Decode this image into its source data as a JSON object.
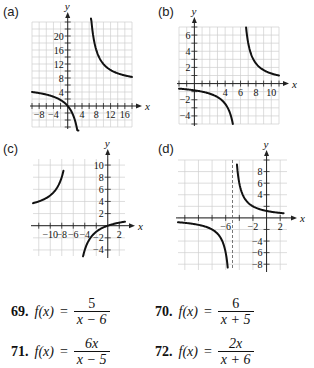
{
  "chart_data": [
    {
      "id": "a",
      "label": "(a)",
      "type": "line",
      "function": "6x/(x-5)",
      "x_range": [
        -10,
        18
      ],
      "y_range": [
        -6,
        24
      ],
      "x_ticks": [
        -8,
        -4,
        4,
        8,
        12,
        16
      ],
      "y_ticks": [
        4,
        8,
        12,
        16,
        20
      ],
      "grid_step": [
        2,
        2
      ],
      "vertical_asymptote": 5,
      "horizontal_asymptote": 6,
      "branches": [
        {
          "x_start": -10,
          "x_end": 3.0
        },
        {
          "x_start": 6.5,
          "x_end": 18
        }
      ],
      "xlabel": "x",
      "ylabel": "y",
      "dashed_asymptote": false
    },
    {
      "id": "b",
      "label": "(b)",
      "type": "line",
      "function": "5/(x-6)",
      "x_range": [
        -2,
        11
      ],
      "y_range": [
        -5,
        7
      ],
      "x_ticks": [
        4,
        6,
        8,
        10
      ],
      "y_ticks": [
        -4,
        -2,
        2,
        4,
        6
      ],
      "extra_x_ticks": [
        2
      ],
      "grid_step": [
        1,
        1
      ],
      "vertical_asymptote": 6,
      "horizontal_asymptote": 0,
      "branches": [
        {
          "x_start": -2,
          "x_end": 5.0
        },
        {
          "x_start": 6.72,
          "x_end": 11
        }
      ],
      "xlabel": "x",
      "ylabel": "y",
      "dashed_asymptote": false
    },
    {
      "id": "c",
      "label": "(c)",
      "type": "line",
      "function": "2x/(x+6)",
      "x_range": [
        -13,
        3
      ],
      "y_range": [
        -5,
        11
      ],
      "x_ticks": [
        -10,
        -8,
        -6,
        -4,
        2
      ],
      "y_ticks": [
        -4,
        -2,
        2,
        4,
        6,
        8,
        10
      ],
      "grid_step": [
        2,
        2
      ],
      "vertical_asymptote": -6,
      "horizontal_asymptote": 2,
      "branches": [
        {
          "x_start": -13,
          "x_end": -7.7
        },
        {
          "x_start": -4.3,
          "x_end": 3
        }
      ],
      "xlabel": "x",
      "ylabel": "y",
      "dashed_asymptote": false
    },
    {
      "id": "d",
      "label": "(d)",
      "type": "line",
      "function": "6/(x+5)",
      "x_range": [
        -13,
        3
      ],
      "y_range": [
        -9,
        10
      ],
      "x_ticks": [
        -6,
        -2,
        2
      ],
      "y_ticks": [
        -8,
        -6,
        -4,
        4,
        6,
        8
      ],
      "grid_step": [
        2,
        2
      ],
      "vertical_asymptote": -5,
      "horizontal_asymptote": 0,
      "branches": [
        {
          "x_start": -13,
          "x_end": -5.7
        },
        {
          "x_start": -4.35,
          "x_end": 2.5
        }
      ],
      "xlabel": "x",
      "ylabel": "y",
      "dashed_asymptote": true
    }
  ],
  "panels": {
    "a": {
      "label": "(a)"
    },
    "b": {
      "label": "(b)"
    },
    "c": {
      "label": "(c)"
    },
    "d": {
      "label": "(d)"
    }
  },
  "exercises": [
    {
      "number": "69.",
      "lhs": "f(x)",
      "eq": "=",
      "numerator": "5",
      "denominator": "x − 6"
    },
    {
      "number": "70.",
      "lhs": "f(x)",
      "eq": "=",
      "numerator": "6",
      "denominator": "x + 5"
    },
    {
      "number": "71.",
      "lhs": "f(x)",
      "eq": "=",
      "numerator": "6x",
      "denominator": "x − 5"
    },
    {
      "number": "72.",
      "lhs": "f(x)",
      "eq": "=",
      "numerator": "2x",
      "denominator": "x + 6"
    }
  ],
  "colors": {
    "grid": "#cfcfcf",
    "axis": "#222222",
    "curve": "#111111",
    "text": "#111111"
  }
}
